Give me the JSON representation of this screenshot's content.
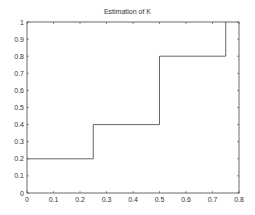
{
  "chart_data": {
    "type": "line",
    "subtype": "step",
    "title": "Estimation of K",
    "xlabel": "",
    "ylabel": "",
    "xlim": [
      0,
      0.8
    ],
    "ylim": [
      0,
      1
    ],
    "xticks": [
      "0",
      "0.1",
      "0.2",
      "0.3",
      "0.4",
      "0.5",
      "0.6",
      "0.7",
      "0.8"
    ],
    "yticks": [
      "0",
      "0.1",
      "0.2",
      "0.3",
      "0.4",
      "0.5",
      "0.6",
      "0.7",
      "0.8",
      "0.9",
      "1"
    ],
    "grid": false,
    "legend": null,
    "series": [
      {
        "name": "K estimate",
        "color": "#555555",
        "x": [
          0,
          0.25,
          0.25,
          0.5,
          0.5,
          0.75,
          0.75
        ],
        "y": [
          0.2,
          0.2,
          0.4,
          0.4,
          0.8,
          0.8,
          1.0
        ]
      }
    ]
  }
}
